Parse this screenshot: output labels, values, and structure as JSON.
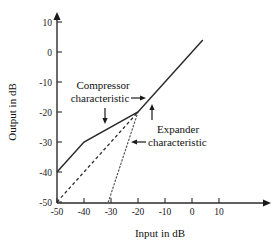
{
  "chart_data": {
    "type": "line",
    "title": "",
    "xlabel": "Input in dB",
    "ylabel": "Output in dB",
    "xlim": [
      -52,
      18
    ],
    "ylim": [
      -52,
      13
    ],
    "grid": false,
    "legend": "none",
    "xticks": [
      -50,
      -40,
      -30,
      -20,
      -10,
      0,
      10
    ],
    "xtick_labels": [
      "-50",
      "-40",
      "-30",
      "-20",
      "-10",
      "0",
      "10"
    ],
    "yticks": [
      10,
      0,
      -10,
      -20,
      -30,
      -40,
      -50
    ],
    "ytick_labels": [
      "10",
      "0",
      "-10",
      "-20",
      "-30",
      "-40",
      "-50"
    ],
    "series": [
      {
        "name": "Compressor characteristic",
        "style": "solid",
        "points": [
          [
            -50,
            -40
          ],
          [
            -40,
            -30
          ],
          [
            -20,
            -20
          ],
          [
            4,
            4
          ]
        ]
      },
      {
        "name": "Linear reference",
        "style": "dashed",
        "points": [
          [
            -50,
            -50
          ],
          [
            -20,
            -20
          ]
        ]
      },
      {
        "name": "Expander characteristic",
        "style": "dotted",
        "points": [
          [
            -31,
            -50
          ],
          [
            -20,
            -20
          ]
        ]
      }
    ],
    "annotations": [
      {
        "id": "compressor-label",
        "line1": "Compressor",
        "line2": "characteristic",
        "arrows": [
          "right-arrow",
          "down-arrow"
        ]
      },
      {
        "id": "expander-label",
        "line1": "Expander",
        "line2": "characteristic",
        "arrows": [
          "up-arrow",
          "left-arrow"
        ]
      }
    ]
  },
  "axes": {
    "x_title": "Input in dB",
    "y_title": "Output in dB"
  },
  "annotations": {
    "compressor_line1": "Compressor",
    "compressor_line2": "characteristic",
    "expander_line1": "Expander",
    "expander_line2": "characteristic"
  },
  "colors": {
    "axis": "#2b2b2b",
    "solid_series": "#2b2b2b",
    "dashed_series": "#2b2b2b",
    "dotted_series": "#555555",
    "text": "#111111",
    "background": "#ffffff"
  }
}
